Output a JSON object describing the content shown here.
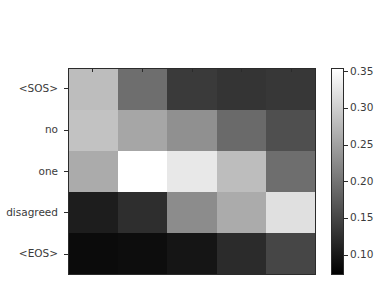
{
  "chart_data": {
    "type": "heatmap",
    "title": "",
    "xlabel": "",
    "ylabel": "",
    "colormap": "gray",
    "grid": false,
    "legend_position": "right",
    "x_categories": [
      "personne",
      "n'exprima",
      "de",
      "désaccord",
      "<EOS>"
    ],
    "y_categories": [
      "<SOS>",
      "no",
      "one",
      "disagreed",
      "<EOS>"
    ],
    "values": [
      [
        0.268,
        0.205,
        0.135,
        0.128,
        0.132
      ],
      [
        0.272,
        0.248,
        0.228,
        0.197,
        0.172
      ],
      [
        0.252,
        0.35,
        0.327,
        0.268,
        0.205
      ],
      [
        0.112,
        0.128,
        0.225,
        0.252,
        0.32
      ],
      [
        0.09,
        0.092,
        0.104,
        0.132,
        0.162
      ]
    ],
    "cell_colors": [
      [
        "#bdbdbd",
        "#6e6e6e",
        "#3a3a3a",
        "#343434",
        "#373737"
      ],
      [
        "#c2c2c2",
        "#a6a6a6",
        "#909090",
        "#6a6a6a",
        "#4f4f4f"
      ],
      [
        "#ababab",
        "#ffffff",
        "#e8e8e8",
        "#bdbdbd",
        "#6e6e6e"
      ],
      [
        "#1d1d1d",
        "#2e2e2e",
        "#8c8c8c",
        "#ababab",
        "#e0e0e0"
      ],
      [
        "#0b0b0b",
        "#0d0d0d",
        "#151515",
        "#2b2b2b",
        "#464646"
      ]
    ],
    "colorbar": {
      "vmin": 0.073,
      "vmax": 0.355,
      "ticks": [
        0.1,
        0.15,
        0.2,
        0.25,
        0.3,
        0.35
      ],
      "tick_labels": [
        "0.10",
        "0.15",
        "0.20",
        "0.25",
        "0.30",
        "0.35"
      ],
      "top_color": "#ffffff",
      "bottom_color": "#000000"
    },
    "axis_color": "#2b2b2b",
    "text_color": "#3b3b3b",
    "background": "#ffffff"
  }
}
